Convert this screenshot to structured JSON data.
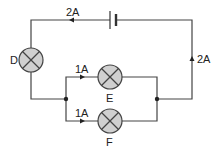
{
  "diagram": {
    "title": "",
    "labels": {
      "lamp_d": "D",
      "lamp_e": "E",
      "lamp_f": "F",
      "current_top": "2A",
      "current_right": "2A",
      "current_e": "1A",
      "current_f": "1A"
    },
    "colors": {
      "wire": "#444444",
      "lamp_fill": "#d0d0d0",
      "junction": "#222222"
    }
  }
}
